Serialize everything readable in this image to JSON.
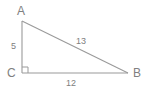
{
  "figure": {
    "type": "right-triangle-diagram",
    "background_color": "#ffffff",
    "line_color": "#9a9a9a",
    "text_color": "#808080",
    "vertices": [
      {
        "name": "A",
        "label": "A",
        "x": 22,
        "y": 21
      },
      {
        "name": "C",
        "label": "C",
        "x": 22,
        "y": 73
      },
      {
        "name": "B",
        "label": "B",
        "x": 128,
        "y": 73
      }
    ],
    "sides": [
      {
        "name": "leg-ac",
        "label": "5",
        "from": "A",
        "to": "C",
        "length": 5
      },
      {
        "name": "leg-cb",
        "label": "12",
        "from": "C",
        "to": "B",
        "length": 12
      },
      {
        "name": "hypotenuse-ab",
        "label": "13",
        "from": "A",
        "to": "B",
        "length": 13
      }
    ],
    "right_angle": {
      "at_vertex": "C",
      "marker": "square",
      "size": 6
    }
  }
}
